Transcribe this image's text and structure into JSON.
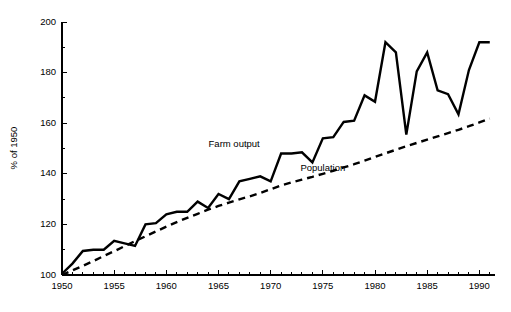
{
  "chart_data": {
    "type": "line",
    "title": "",
    "subtitle": "",
    "xlabel": "",
    "ylabel": "% of 1950",
    "xlim": [
      1950,
      1992
    ],
    "ylim": [
      100,
      200
    ],
    "grid": false,
    "legend_position": "inline-annotations",
    "x_ticks_major": [
      1950,
      1955,
      1960,
      1965,
      1970,
      1975,
      1980,
      1985,
      1990
    ],
    "x_tick_labels": [
      "1950",
      "1955",
      "1960",
      "1965",
      "1970",
      "1975",
      "1980",
      "1985",
      "1990"
    ],
    "x_tick_minor_step": 1,
    "y_ticks_major": [
      100,
      120,
      140,
      160,
      180,
      200
    ],
    "y_tick_labels": [
      "100",
      "120",
      "140",
      "160",
      "180",
      "200"
    ],
    "y_tick_minor": [
      110,
      130,
      150,
      170,
      190
    ],
    "x": [
      1950,
      1951,
      1952,
      1953,
      1954,
      1955,
      1956,
      1957,
      1958,
      1959,
      1960,
      1961,
      1962,
      1963,
      1964,
      1965,
      1966,
      1967,
      1968,
      1969,
      1970,
      1971,
      1972,
      1973,
      1974,
      1975,
      1976,
      1977,
      1978,
      1979,
      1980,
      1981,
      1982,
      1983,
      1984,
      1985,
      1986,
      1987,
      1988,
      1989,
      1990,
      1991
    ],
    "series": [
      {
        "name": "Farm output",
        "style": "solid",
        "label_x": 1966.5,
        "label_y": 150.5,
        "values": [
          100.5,
          104.5,
          109.5,
          110.0,
          110.0,
          113.5,
          112.5,
          111.5,
          120.0,
          120.5,
          124.0,
          125.0,
          125.0,
          129.0,
          126.5,
          132.0,
          130.0,
          137.0,
          138.0,
          139.0,
          137.0,
          148.0,
          148.0,
          148.5,
          144.5,
          154.0,
          154.5,
          160.5,
          161.0,
          171.0,
          168.5,
          192.0,
          188.0,
          155.5,
          180.5,
          188.0,
          173.0,
          171.5,
          163.5,
          181.0,
          192.0,
          192.0
        ]
      },
      {
        "name": "Population",
        "style": "dashed",
        "label_x": 1975.0,
        "label_y": 141.0,
        "values": [
          100.0,
          101.8,
          103.6,
          105.5,
          107.5,
          109.4,
          111.4,
          113.4,
          115.3,
          117.2,
          119.1,
          120.9,
          122.6,
          124.2,
          125.8,
          127.3,
          128.6,
          129.9,
          131.1,
          132.4,
          133.9,
          135.4,
          136.6,
          137.7,
          138.8,
          140.0,
          141.2,
          142.5,
          143.8,
          145.2,
          146.7,
          148.1,
          149.5,
          150.9,
          152.2,
          153.5,
          154.8,
          156.1,
          157.4,
          158.8,
          160.3,
          161.8
        ]
      }
    ]
  },
  "annotations": {
    "farm_output_label": "Farm output",
    "population_label": "Population"
  },
  "axis": {
    "y_title": "% of 1950"
  }
}
